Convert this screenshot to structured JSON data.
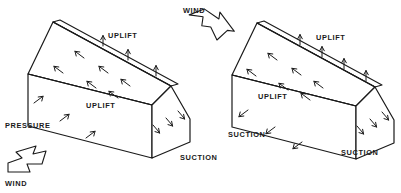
{
  "diagram": {
    "background_color": "#ffffff",
    "ink_color": "#1a1a1a"
  },
  "labels": {
    "wind_top": "WIND",
    "wind_bottom": "WIND",
    "uplift_left_roof_upper": "UPLIFT",
    "uplift_left_roof_lower": "UPLIFT",
    "pressure_left_wall": "PRESSURE",
    "suction_left_gable": "SUCTION",
    "uplift_right_roof_upper": "UPLIFT",
    "uplift_right_roof_lower": "UPLIFT",
    "suction_right_wall": "SUCTION",
    "suction_right_gable": "SUCTION"
  },
  "houses": [
    {
      "name": "left-house",
      "wall_force": "PRESSURE",
      "wall_arrow_direction": "up-right (toward wall)",
      "roof_force": "UPLIFT",
      "gable_force": "SUCTION",
      "wind_direction": "up-right"
    },
    {
      "name": "right-house",
      "wall_force": "SUCTION",
      "wall_arrow_direction": "down-left (away from wall)",
      "roof_force": "UPLIFT",
      "gable_force": "SUCTION",
      "wind_direction": "down-right"
    }
  ],
  "wind_arrows": [
    {
      "name": "wind-arrow-top",
      "label": "WIND",
      "direction": "down-right"
    },
    {
      "name": "wind-arrow-bottom",
      "label": "WIND",
      "direction": "up-right"
    }
  ]
}
